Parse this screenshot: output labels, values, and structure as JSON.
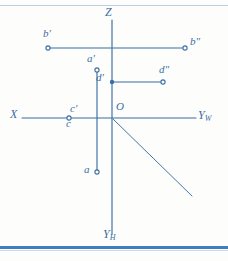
{
  "diagram": {
    "ink_color": "#3b6ea5",
    "paper_color": "#fdfdfb",
    "border_color": "#3f7fc1",
    "axes": [
      {
        "name": "Z",
        "label": "Z",
        "x1": 112,
        "y1": 20,
        "x2": 112,
        "y2": 234
      },
      {
        "name": "X",
        "label": "X",
        "x1": 22,
        "y1": 118,
        "x2": 112,
        "y2": 118
      },
      {
        "name": "YW",
        "label": "Y",
        "sub": "W",
        "x1": 112,
        "y1": 118,
        "x2": 196,
        "y2": 118
      },
      {
        "name": "YH",
        "label": "Y",
        "sub": "H",
        "x1": 112,
        "y1": 118,
        "x2": 112,
        "y2": 234
      },
      {
        "name": "bisector",
        "label": "",
        "x1": 113,
        "y1": 119,
        "x2": 192,
        "y2": 196
      }
    ],
    "axis_labels": [
      {
        "name": "z-axis-label",
        "text": "Z",
        "sub": "",
        "x": 105,
        "y": 8
      },
      {
        "name": "x-axis-label",
        "text": "X",
        "sub": "",
        "x": 10,
        "y": 110
      },
      {
        "name": "yw-axis-label",
        "text": "Y",
        "sub": "W",
        "x": 198,
        "y": 110
      },
      {
        "name": "yh-axis-label",
        "text": "Y",
        "sub": "H",
        "x": 104,
        "y": 232
      },
      {
        "name": "origin-label",
        "text": "O",
        "sub": "",
        "x": 116,
        "y": 103
      }
    ],
    "points": [
      {
        "name": "b-prime",
        "label": "b",
        "prime": "'",
        "px": 48,
        "py": 48,
        "lx": 44,
        "ly": 30
      },
      {
        "name": "b-double",
        "label": "b",
        "prime": "″",
        "px": 185,
        "py": 48,
        "lx": 191,
        "ly": 38
      },
      {
        "name": "a-prime",
        "label": "a",
        "prime": "'",
        "px": 97,
        "py": 70,
        "lx": 88,
        "ly": 55
      },
      {
        "name": "d-prime",
        "label": "d",
        "prime": "'",
        "px": 112,
        "py": 82,
        "lx": 97,
        "ly": 73
      },
      {
        "name": "d-double",
        "label": "d",
        "prime": "″",
        "px": 163,
        "py": 82,
        "lx": 160,
        "ly": 66
      },
      {
        "name": "c-prime",
        "label": "c",
        "prime": "'",
        "px": 69,
        "py": 118,
        "lx": 68,
        "ly": 104
      },
      {
        "name": "c",
        "label": "c",
        "prime": "",
        "px": 69,
        "py": 118,
        "lx": 66,
        "ly": 118
      },
      {
        "name": "a",
        "label": "a",
        "prime": "",
        "px": 97,
        "py": 172,
        "lx": 85,
        "ly": 164
      }
    ],
    "connector_lines": [
      {
        "name": "b-projection-line",
        "x1": 48,
        "y1": 48,
        "x2": 185,
        "y2": 48
      },
      {
        "name": "d-projection-line",
        "x1": 112,
        "y1": 82,
        "x2": 163,
        "y2": 82
      },
      {
        "name": "a-vertical-line",
        "x1": 97,
        "y1": 70,
        "x2": 97,
        "y2": 172
      }
    ]
  }
}
